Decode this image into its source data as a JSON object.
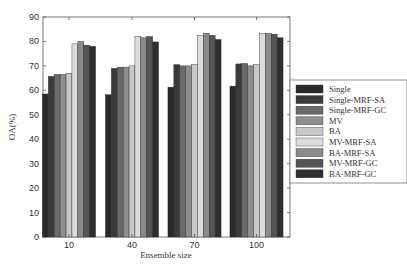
{
  "chart_data": {
    "type": "bar",
    "title": "",
    "xlabel": "Ensemble size",
    "ylabel": "OA(%)",
    "ylim": [
      0,
      90
    ],
    "yticks": [
      0,
      10,
      20,
      30,
      40,
      50,
      60,
      70,
      80,
      90
    ],
    "categories": [
      "10",
      "40",
      "70",
      "100"
    ],
    "grid": false,
    "legend_position": "right",
    "series": [
      {
        "name": "Single",
        "color": "#2a2a2a",
        "values": [
          58.5,
          58.2,
          61.3,
          61.7
        ]
      },
      {
        "name": "Single-MRF-SA",
        "color": "#3a3a3a",
        "values": [
          65.7,
          69.0,
          70.5,
          70.8
        ]
      },
      {
        "name": "Single-MRF-GC",
        "color": "#6a6a6a",
        "values": [
          66.5,
          69.5,
          70.0,
          71.0
        ]
      },
      {
        "name": "MV",
        "color": "#8e8e8e",
        "values": [
          66.5,
          69.5,
          70.0,
          70.0
        ]
      },
      {
        "name": "BA",
        "color": "#c8c8c8",
        "values": [
          67.0,
          70.0,
          70.5,
          70.5
        ]
      },
      {
        "name": "MV-MRF-SA",
        "color": "#dcdcdc",
        "values": [
          79.0,
          82.0,
          82.5,
          83.2
        ]
      },
      {
        "name": "BA-MRF-SA",
        "color": "#8a8a8a",
        "values": [
          80.0,
          81.5,
          83.3,
          83.3
        ]
      },
      {
        "name": "MV-MRF-GC",
        "color": "#555555",
        "values": [
          78.5,
          82.0,
          82.5,
          83.0
        ]
      },
      {
        "name": "BA-MRF-GC",
        "color": "#2e2e2e",
        "values": [
          78.0,
          79.8,
          80.8,
          81.5
        ]
      }
    ]
  }
}
